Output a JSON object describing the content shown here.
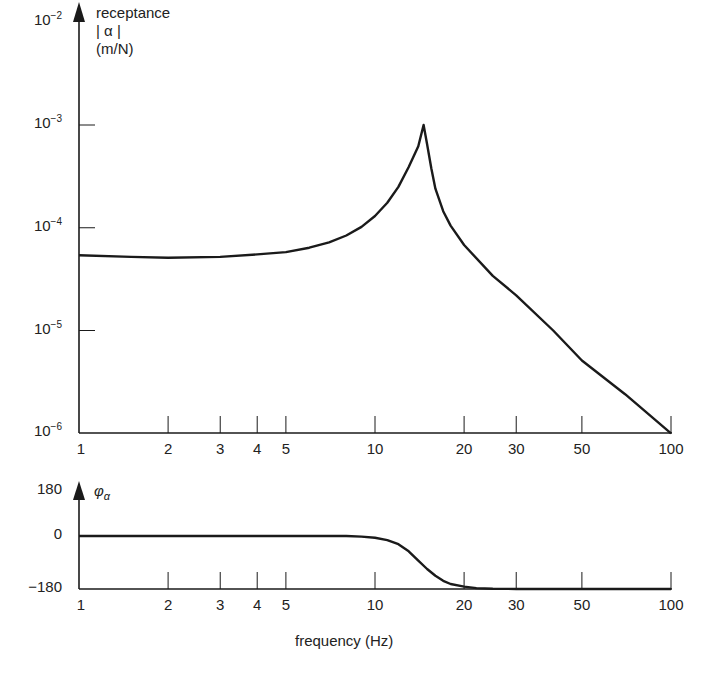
{
  "chart_data": [
    {
      "type": "line",
      "title": "",
      "ylabel": "receptance |α| (m/N)",
      "ylabel_lines": [
        "receptance",
        "| α |",
        "(m/N)"
      ],
      "xlabel": "",
      "xscale": "log",
      "yscale": "log",
      "xlim": [
        1,
        100
      ],
      "ylim": [
        1e-06,
        0.01
      ],
      "x_ticks": [
        1,
        2,
        3,
        4,
        5,
        10,
        20,
        30,
        50,
        100
      ],
      "x_tick_labels": [
        "1",
        "2",
        "3",
        "4",
        "5",
        "10",
        "20",
        "30",
        "50",
        "100"
      ],
      "y_ticks": [
        1e-06,
        1e-05,
        0.0001,
        0.001,
        0.01
      ],
      "y_tick_labels": [
        {
          "base": "10",
          "exp": "−6"
        },
        {
          "base": "10",
          "exp": "−5"
        },
        {
          "base": "10",
          "exp": "−4"
        },
        {
          "base": "10",
          "exp": "−3"
        },
        {
          "base": "10",
          "exp": "−2"
        }
      ],
      "grid": false,
      "series": [
        {
          "name": "|α|",
          "x": [
            1,
            1.5,
            2,
            3,
            4,
            5,
            6,
            7,
            8,
            9,
            10,
            11,
            12,
            13,
            14,
            14.6,
            15,
            15.5,
            16,
            17,
            18,
            20,
            25,
            30,
            40,
            50,
            70,
            100
          ],
          "values": [
            5.4e-05,
            5.2e-05,
            5.1e-05,
            5.2e-05,
            5.5e-05,
            5.8e-05,
            6.4e-05,
            7.2e-05,
            8.4e-05,
            0.000102,
            0.00013,
            0.000175,
            0.00025,
            0.00039,
            0.00062,
            0.001,
            0.00065,
            0.00038,
            0.00024,
            0.000145,
            0.000105,
            6.8e-05,
            3.4e-05,
            2.2e-05,
            1e-05,
            5.1e-06,
            2.4e-06,
            1e-06
          ]
        }
      ]
    },
    {
      "type": "line",
      "title": "",
      "ylabel": "φα",
      "xlabel": "frequency (Hz)",
      "xscale": "log",
      "xlim": [
        1,
        100
      ],
      "ylim": [
        -180,
        180
      ],
      "x_ticks": [
        1,
        2,
        3,
        4,
        5,
        10,
        20,
        30,
        50,
        100
      ],
      "x_tick_labels": [
        "1",
        "2",
        "3",
        "4",
        "5",
        "10",
        "20",
        "30",
        "50",
        "100"
      ],
      "y_ticks": [
        -180,
        0,
        180
      ],
      "y_tick_labels": [
        "−180",
        "0",
        "180"
      ],
      "grid": false,
      "series": [
        {
          "name": "φα",
          "x": [
            1,
            2,
            5,
            8,
            9,
            10,
            11,
            12,
            13,
            14,
            15,
            16,
            17,
            18,
            20,
            22,
            25,
            30,
            50,
            100
          ],
          "values": [
            0,
            0,
            0,
            0,
            -2,
            -6,
            -14,
            -28,
            -52,
            -84,
            -112,
            -135,
            -152,
            -163,
            -172,
            -177,
            -179,
            -180,
            -180,
            -180
          ]
        }
      ]
    }
  ],
  "labels": {
    "mag_y_title_1": "receptance",
    "mag_y_title_2": "| α |",
    "mag_y_title_3": "(m/N)",
    "phase_y_title": "φ",
    "phase_y_title_sub": "α",
    "x_title": "frequency (Hz)"
  }
}
